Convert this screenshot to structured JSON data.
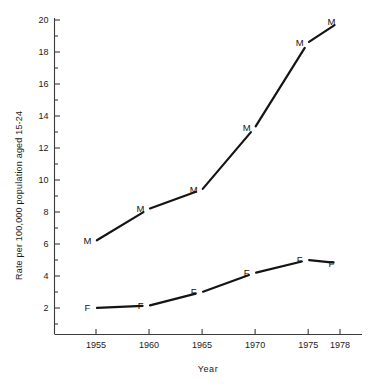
{
  "chart_data": {
    "type": "line",
    "title": "",
    "subtitle": "",
    "xlabel": "Year",
    "ylabel": "Rate per 100,000 population aged 15-24",
    "x": [
      1955,
      1960,
      1965,
      1970,
      1975,
      1978
    ],
    "xtick_labels": [
      "1955",
      "1960",
      "1965",
      "1970",
      "1975",
      "1978"
    ],
    "ytick_labels": [
      "2",
      "4",
      "6",
      "8",
      "10",
      "12",
      "14",
      "16",
      "18",
      "20"
    ],
    "ytick_values": [
      2,
      4,
      6,
      8,
      10,
      12,
      14,
      16,
      18,
      20
    ],
    "yminor_values": [
      1,
      3,
      5,
      7,
      9,
      11,
      13,
      15,
      17,
      19
    ],
    "xlim": [
      1952.5,
      1979.5
    ],
    "ylim": [
      0.5,
      20.6
    ],
    "grid": false,
    "legend": "point-markers",
    "legend_position": "inline",
    "series": [
      {
        "name": "M",
        "marker_label": "M",
        "marker_side": "left",
        "values": [
          6.2,
          8.2,
          9.4,
          13.3,
          18.6,
          19.9
        ]
      },
      {
        "name": "F",
        "marker_label": "F",
        "marker_side": "left",
        "values": [
          2.0,
          2.15,
          3.0,
          4.2,
          5.0,
          4.8
        ]
      }
    ],
    "colors": {
      "line": "#141414",
      "axis": "#3a3a3a",
      "text": "#1a1a1a",
      "background": "#ffffff"
    }
  }
}
